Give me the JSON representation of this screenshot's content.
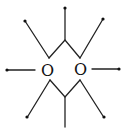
{
  "diagram": {
    "type": "molecular-structure",
    "atoms": [
      {
        "label": "O",
        "x": 47,
        "y": 76
      },
      {
        "label": "O",
        "x": 79,
        "y": 75
      }
    ],
    "colors": {
      "line": "#222222",
      "background": "#ffffff"
    }
  }
}
